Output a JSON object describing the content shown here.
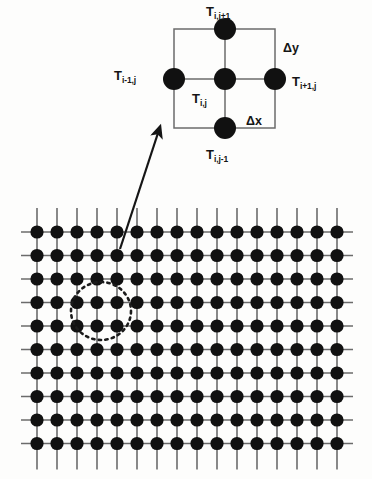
{
  "figure": {
    "background_color": "#fdfdfc",
    "node_color": "#111111",
    "line_color": "#5a5a5a",
    "text_color": "#151515"
  },
  "stencil": {
    "box": {
      "x": 174,
      "y": 29,
      "width": 101,
      "height": 99
    },
    "center": {
      "x": 225,
      "y": 79
    },
    "spacing": {
      "dx": 50,
      "dy": 50
    },
    "node_radius": 11,
    "nodes": [
      {
        "name": "center",
        "cx": 225,
        "cy": 79
      },
      {
        "name": "north",
        "cx": 225,
        "cy": 29
      },
      {
        "name": "south",
        "cx": 225,
        "cy": 128
      },
      {
        "name": "west",
        "cx": 174,
        "cy": 79
      },
      {
        "name": "east",
        "cx": 275,
        "cy": 79
      }
    ],
    "labels": {
      "north": {
        "base": "T",
        "sub": "i,j+1",
        "x": 206,
        "y": 5
      },
      "south": {
        "base": "T",
        "sub": "i,j-1",
        "x": 206,
        "y": 148
      },
      "west": {
        "base": "T",
        "sub": "i-1,j",
        "x": 114,
        "y": 69
      },
      "east": {
        "base": "T",
        "sub": "i+1,j",
        "x": 292,
        "y": 75
      },
      "center": {
        "base": "T",
        "sub": "i,j",
        "x": 192,
        "y": 92
      }
    },
    "delta_labels": {
      "dy": {
        "text": "Δy",
        "x": 283,
        "y": 42
      },
      "dx": {
        "text": "Δx",
        "x": 246,
        "y": 115
      }
    }
  },
  "arrow": {
    "name": "callout-arrow",
    "from": {
      "x": 120,
      "y": 249
    },
    "to": {
      "x": 158,
      "y": 133
    }
  },
  "highlight": {
    "name": "stencil-highlight-ellipse",
    "cx": 101,
    "cy": 311,
    "rx": 30,
    "ry": 29,
    "style": "dotted"
  },
  "lattice": {
    "columns": 16,
    "rows": 10,
    "origin": {
      "x": 37,
      "y": 232
    },
    "spacing": {
      "x": 20,
      "y": 23.5
    },
    "node_radius": 6.6,
    "stub_length": 16
  }
}
